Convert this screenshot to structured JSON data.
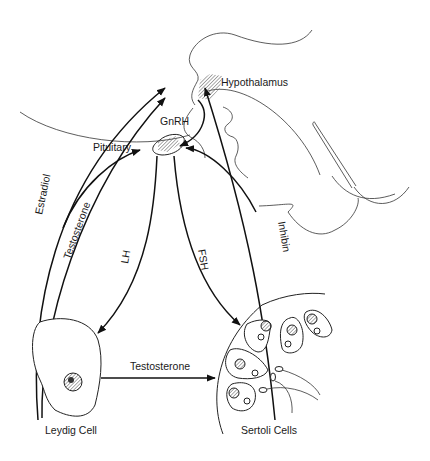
{
  "diagram": {
    "structures": {
      "hypothalamus": "Hypothalamus",
      "pituitary": "Pituitary",
      "leydig": "Leydig Cell",
      "sertoli": "Sertoli Cells"
    },
    "hormones": {
      "gnrh": "GnRH",
      "lh": "LH",
      "fsh": "FSH",
      "estradiol": "Estradiol",
      "testosterone_feedback": "Testosterone",
      "inhibin": "Inhibin",
      "testosterone_local": "Testosterone"
    },
    "edges": [
      {
        "from": "Hypothalamus",
        "to": "Pituitary",
        "label": "GnRH"
      },
      {
        "from": "Pituitary",
        "to": "Leydig Cell",
        "label": "LH"
      },
      {
        "from": "Pituitary",
        "to": "Sertoli Cells",
        "label": "FSH"
      },
      {
        "from": "Leydig Cell",
        "to": "Hypothalamus",
        "label": "Estradiol"
      },
      {
        "from": "Leydig Cell",
        "to": "Hypothalamus/Pituitary",
        "label": "Testosterone"
      },
      {
        "from": "Sertoli Cells",
        "to": "Hypothalamus/Pituitary",
        "label": "Inhibin"
      },
      {
        "from": "Leydig Cell",
        "to": "Sertoli Cells",
        "label": "Testosterone"
      }
    ],
    "colors": {
      "line": "#111111",
      "background": "#ffffff",
      "hatch": "#555555"
    }
  }
}
